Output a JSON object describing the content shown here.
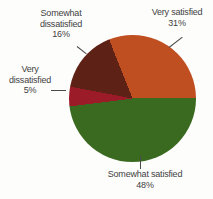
{
  "chart_data": {
    "type": "pie",
    "title": "",
    "legend_position": "none",
    "labels_outside_with_leader_lines": true,
    "start_angle": "3-oclock",
    "direction": "clockwise",
    "slices": [
      {
        "label": "Somewhat satisfied",
        "value": 48,
        "pct_label": "48%",
        "color": "#3a6a1f",
        "label_position": "bottom"
      },
      {
        "label": "Very dissatisfied",
        "value": 5,
        "pct_label": "5%",
        "color": "#9b1c28",
        "label_position": "left"
      },
      {
        "label": "Somewhat dissatisfied",
        "value": 16,
        "pct_label": "16%",
        "color": "#5e2116",
        "label_position": "top-left"
      },
      {
        "label": "Very satisfied",
        "value": 31,
        "pct_label": "31%",
        "color": "#bf4e21",
        "label_position": "top-right"
      }
    ],
    "colors": {
      "text": "#3f3f3f",
      "leader_line": "#4a4a4a",
      "background": "#fdfdfc"
    }
  }
}
